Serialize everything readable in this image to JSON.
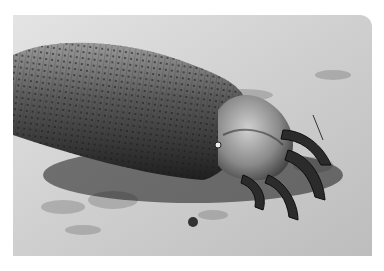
{
  "image": {
    "subject": "scanning electron micrograph of a demodex mite on skin surface",
    "tone": "grayscale",
    "colors": {
      "background": "#ffffff",
      "surface_light": "#d9d9d9",
      "surface_mid": "#a8a8a8",
      "body_dark": "#3a3a3a",
      "shadow": "#111111"
    }
  }
}
